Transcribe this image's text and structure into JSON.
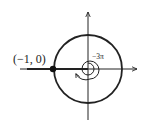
{
  "diagram": {
    "point_label": "(−1, 0)",
    "angle_label": "−3π",
    "colors": {
      "stroke": "#222222",
      "background": "#ffffff"
    },
    "elements": {
      "x_axis": "horizontal axis with arrow pointing right",
      "y_axis": "vertical axis with arrow pointing up",
      "unit_circle": "circle centered at origin",
      "point": "filled dot at (-1, 0)",
      "ray": "thick line from origin along negative x-axis",
      "spiral": "clockwise spiral arrow around origin indicating -3π rotation"
    }
  }
}
